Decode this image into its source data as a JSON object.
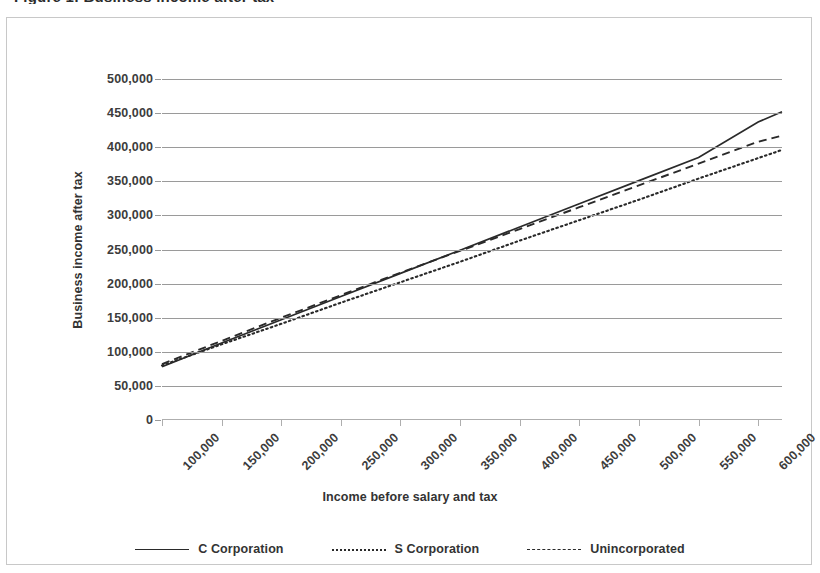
{
  "document": {
    "cropped_heading_sliver": "Figure 1: Business income after tax"
  },
  "chart_data": {
    "type": "line",
    "title": "",
    "xlabel": "Income before salary and tax",
    "ylabel": "Business income after tax",
    "xlim": [
      100000,
      620000
    ],
    "ylim": [
      0,
      500000
    ],
    "grid": true,
    "legend_position": "bottom",
    "x_tick_labels": [
      "100,000",
      "150,000",
      "200,000",
      "250,000",
      "300,000",
      "350,000",
      "400,000",
      "450,000",
      "500,000",
      "550,000",
      "600,000"
    ],
    "x_ticks": [
      100000,
      150000,
      200000,
      250000,
      300000,
      350000,
      400000,
      450000,
      500000,
      550000,
      600000
    ],
    "y_tick_labels": [
      "0",
      "50,000",
      "100,000",
      "150,000",
      "200,000",
      "250,000",
      "300,000",
      "350,000",
      "400,000",
      "450,000",
      "500,000"
    ],
    "y_ticks": [
      0,
      50000,
      100000,
      150000,
      200000,
      250000,
      300000,
      350000,
      400000,
      450000,
      500000
    ],
    "x": [
      100000,
      150000,
      200000,
      250000,
      300000,
      350000,
      400000,
      450000,
      500000,
      550000,
      600000,
      620000
    ],
    "series": [
      {
        "name": "C Corporation",
        "style": "solid",
        "color": "#2a2a2a",
        "values": [
          78000,
          113000,
          147000,
          181000,
          215000,
          249000,
          283000,
          317000,
          351000,
          385000,
          437000,
          452000
        ]
      },
      {
        "name": "S Corporation",
        "style": "dotted",
        "color": "#2a2a2a",
        "values": [
          80000,
          111000,
          141000,
          172000,
          202000,
          232000,
          263000,
          293000,
          323000,
          354000,
          384000,
          396000
        ]
      },
      {
        "name": "Unincorporated",
        "style": "dashed",
        "color": "#2a2a2a",
        "values": [
          82000,
          116000,
          150000,
          183000,
          216000,
          248000,
          280000,
          312000,
          344000,
          376000,
          408000,
          417000
        ]
      }
    ]
  },
  "legend": {
    "items": [
      {
        "label": "C Corporation",
        "style": "solid"
      },
      {
        "label": "S Corporation",
        "style": "dotted"
      },
      {
        "label": "Unincorporated",
        "style": "dashed"
      }
    ]
  }
}
